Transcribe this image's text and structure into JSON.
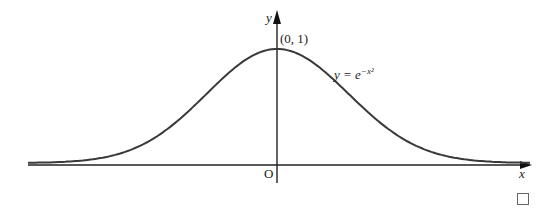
{
  "chart_data": {
    "type": "line",
    "title": "",
    "function": "y = e^{-x^2}",
    "xlabel": "x",
    "ylabel": "y",
    "origin_label": "O",
    "annotations": [
      {
        "text": "(0, 1)",
        "x": 0,
        "y": 1,
        "note": "maximum point"
      },
      {
        "text": "y = e^{-x^2}",
        "note": "curve label"
      }
    ],
    "grid": false,
    "legend": null,
    "xlim": [
      -2.5,
      2.5
    ],
    "ylim": [
      0,
      1.1
    ],
    "x": [
      -2.5,
      -2.0,
      -1.5,
      -1.0,
      -0.75,
      -0.5,
      -0.25,
      0,
      0.25,
      0.5,
      0.75,
      1.0,
      1.5,
      2.0,
      2.5
    ],
    "series": [
      {
        "name": "y = e^{-x^2}",
        "values": [
          0.002,
          0.018,
          0.105,
          0.368,
          0.57,
          0.779,
          0.939,
          1.0,
          0.939,
          0.779,
          0.57,
          0.368,
          0.105,
          0.018,
          0.002
        ]
      }
    ]
  },
  "labels": {
    "y_axis": "y",
    "x_axis": "x",
    "origin": "O",
    "point": "(0, 1)",
    "equation_lhs": "y = ",
    "equation_base": "e",
    "equation_exp": "−x²",
    "qed": ""
  },
  "colors": {
    "curve": "#3a3a3a",
    "axes": "#222222",
    "background": "#ffffff"
  }
}
